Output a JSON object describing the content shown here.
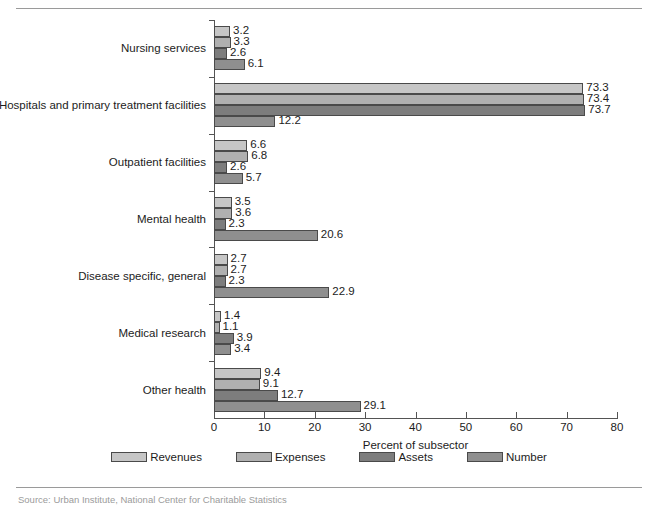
{
  "chart_data": {
    "type": "bar",
    "orientation": "horizontal",
    "title": "",
    "xlabel": "Percent of subsector",
    "ylabel": "",
    "xlim": [
      0,
      80
    ],
    "xticks": [
      0,
      10,
      20,
      30,
      40,
      50,
      60,
      70,
      80
    ],
    "grid": false,
    "legend_position": "bottom",
    "categories": [
      "Nursing services",
      "Hospitals and primary treatment facilities",
      "Outpatient facilities",
      "Mental health",
      "Disease specific, general",
      "Medical research",
      "Other health"
    ],
    "series": [
      {
        "name": "Revenues",
        "color": "#c6c6c6",
        "values": [
          3.2,
          73.3,
          6.6,
          3.5,
          2.7,
          1.4,
          9.4
        ]
      },
      {
        "name": "Expenses",
        "color": "#b0b0b0",
        "values": [
          3.3,
          73.4,
          6.8,
          3.6,
          2.7,
          1.1,
          9.1
        ]
      },
      {
        "name": "Assets",
        "color": "#7d7d7d",
        "values": [
          2.6,
          73.7,
          2.6,
          2.3,
          2.3,
          3.9,
          12.7
        ]
      },
      {
        "name": "Number",
        "color": "#8f8f8f",
        "values": [
          6.1,
          12.2,
          5.7,
          20.6,
          22.9,
          3.4,
          29.1
        ]
      }
    ]
  },
  "legend": {
    "items": [
      {
        "label": "Revenues",
        "color": "#c6c6c6"
      },
      {
        "label": "Expenses",
        "color": "#b0b0b0"
      },
      {
        "label": "Assets",
        "color": "#7d7d7d"
      },
      {
        "label": "Number",
        "color": "#8f8f8f"
      }
    ]
  },
  "axis": {
    "x_title": "Percent of subsector",
    "x_tick_labels": [
      "0",
      "10",
      "20",
      "30",
      "40",
      "50",
      "60",
      "70",
      "80"
    ]
  },
  "footer": {
    "source": "Source: Urban Institute, National Center for Charitable Statistics"
  },
  "colors": {
    "axis": "#545454",
    "bar_outline": "#4a4a4a",
    "rule": "#9a9a9a",
    "text": "#1c1c1c",
    "source_text": "#9b9b9b"
  }
}
